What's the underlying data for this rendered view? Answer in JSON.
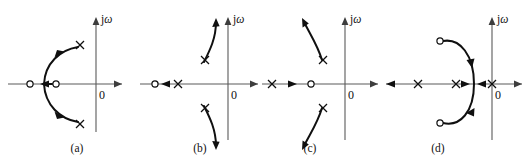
{
  "figure": {
    "background_color": "#ffffff",
    "width": 531,
    "height": 166,
    "axis_color": "#5a5a5a",
    "locus_color": "#101010"
  },
  "panels": [
    {
      "id": "a",
      "caption": "(a)",
      "imaginary_axis_label_j": "j",
      "imaginary_axis_label_omega": "ω",
      "origin_label": "0",
      "real_axis_y": 84,
      "imag_axis_x": 96,
      "poles": [
        {
          "name": "pole-upper-right",
          "x": 80,
          "y": 45
        },
        {
          "name": "pole-lower-right",
          "x": 80,
          "y": 124
        }
      ],
      "zeros": [
        {
          "name": "zero-outer-left",
          "x": 30,
          "y": 84
        },
        {
          "name": "zero-inner",
          "x": 56,
          "y": 84
        }
      ],
      "real_axis_direction_arrows": [
        {
          "name": "real-axis-arrow-left",
          "x": 46,
          "y": 84,
          "direction": "left"
        }
      ],
      "locus_description": "Circular arc bulging to the left, breaking away from the real axis between the two zeros and travelling outward to the two complex poles"
    },
    {
      "id": "b",
      "caption": "(b)",
      "imaginary_axis_label_j": "j",
      "imaginary_axis_label_omega": "ω",
      "origin_label": "0",
      "real_axis_y": 84,
      "imag_axis_x": 228,
      "poles": [
        {
          "name": "pole-upper",
          "x": 205,
          "y": 60
        },
        {
          "name": "pole-lower",
          "x": 205,
          "y": 108
        },
        {
          "name": "pole-real",
          "x": 178,
          "y": 84
        }
      ],
      "zeros": [
        {
          "name": "zero-far-left",
          "x": 155,
          "y": 84
        }
      ],
      "real_axis_direction_arrows": [
        {
          "name": "real-axis-arrow-left",
          "x": 166,
          "y": 84,
          "direction": "left"
        }
      ],
      "locus_description": "Two branches leaving the complex poles and curving upward/downward away from the real axis, crossing the imaginary axis region toward infinity"
    },
    {
      "id": "c",
      "caption": "(c)",
      "imaginary_axis_label_j": "j",
      "imaginary_axis_label_omega": "ω",
      "origin_label": "0",
      "real_axis_y": 84,
      "imag_axis_x": 345,
      "poles": [
        {
          "name": "pole-real-left",
          "x": 272,
          "y": 84
        },
        {
          "name": "pole-upper",
          "x": 323,
          "y": 60
        },
        {
          "name": "pole-lower",
          "x": 323,
          "y": 108
        }
      ],
      "zeros": [
        {
          "name": "zero-real",
          "x": 311,
          "y": 84
        }
      ],
      "real_axis_direction_arrows": [
        {
          "name": "real-axis-arrow-right",
          "x": 292,
          "y": 84,
          "direction": "right"
        }
      ],
      "locus_description": "Two branches leaving the complex poles and sweeping up-left and down-left toward infinity, plus a real-axis branch moving right from the real pole toward the zero"
    },
    {
      "id": "d",
      "caption": "(d)",
      "imaginary_axis_label_j": "j",
      "imaginary_axis_label_omega": "ω",
      "origin_label": "0",
      "real_axis_y": 84,
      "imag_axis_x": 492,
      "poles": [
        {
          "name": "pole-left",
          "x": 418,
          "y": 84
        },
        {
          "name": "pole-middle",
          "x": 456,
          "y": 84
        },
        {
          "name": "pole-origin",
          "x": 492,
          "y": 84
        }
      ],
      "zeros": [
        {
          "name": "zero-upper-left",
          "x": 440,
          "y": 41
        },
        {
          "name": "zero-lower-left",
          "x": 440,
          "y": 123
        }
      ],
      "real_axis_direction_arrows": [
        {
          "name": "real-axis-arrow-far-left",
          "x": 390,
          "y": 84,
          "direction": "left"
        },
        {
          "name": "real-axis-arrow-toward-breakaway-right",
          "x": 466,
          "y": 84,
          "direction": "right"
        },
        {
          "name": "real-axis-arrow-toward-breakaway-left",
          "x": 481,
          "y": 84,
          "direction": "left"
        }
      ],
      "locus_description": "Large closed-looking arc bulging right, breaking away from the real axis between the middle pole and the origin pole, then curving around clockwise into the two complex zeros on the left"
    }
  ]
}
